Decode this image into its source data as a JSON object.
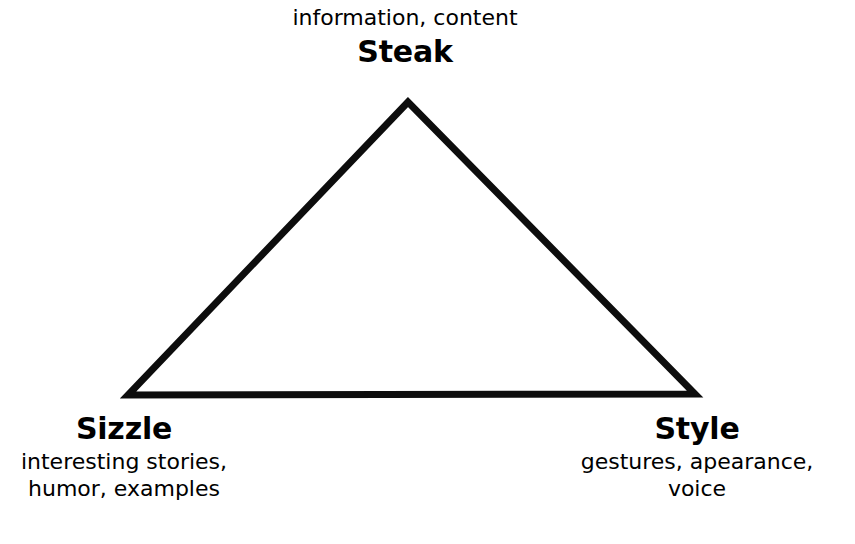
{
  "diagram": {
    "kind": "triangle-diagram",
    "background_color": "#ffffff",
    "stroke_color": "#000000",
    "stroke_width": 7,
    "vertices": {
      "apex": {
        "id": "steak",
        "title": "Steak",
        "caption": "information, content",
        "desc_lines": [
          "information, content"
        ],
        "position": "top-center"
      },
      "bottom_left": {
        "id": "sizzle",
        "title": "Sizzle",
        "desc_lines": [
          "interesting stories,",
          "humor, examples"
        ],
        "position": "bottom-left"
      },
      "bottom_right": {
        "id": "style",
        "title": "Style",
        "desc_lines": [
          "gestures, apearance,",
          "voice"
        ],
        "position": "bottom-right"
      }
    }
  },
  "chart_data": {
    "type": "diagram",
    "title": "",
    "shape": "triangle",
    "nodes": [
      {
        "label": "Steak",
        "detail": "information, content",
        "corner": "apex",
        "x": 408,
        "y": 102
      },
      {
        "label": "Sizzle",
        "detail": "interesting stories, humor, examples",
        "corner": "bottom-left",
        "x": 128,
        "y": 395
      },
      {
        "label": "Style",
        "detail": "gestures, apearance, voice",
        "corner": "bottom-right",
        "x": 695,
        "y": 394
      }
    ],
    "edges": [
      {
        "from": "Steak",
        "to": "Sizzle"
      },
      {
        "from": "Sizzle",
        "to": "Style"
      },
      {
        "from": "Style",
        "to": "Steak"
      }
    ],
    "stroke_color": "#000000",
    "fill_color": "none",
    "grid": false,
    "legend": false
  }
}
